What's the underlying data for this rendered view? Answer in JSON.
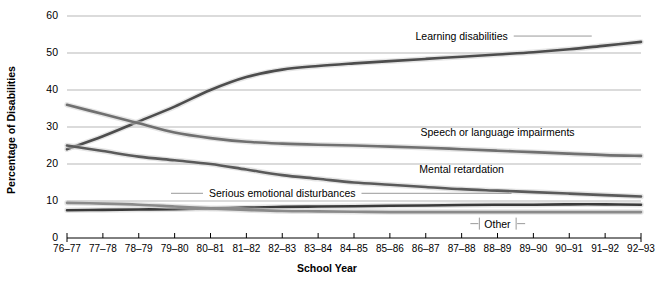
{
  "chart_data": {
    "type": "line",
    "title": "",
    "xlabel": "School Year",
    "ylabel": "Percentage of Disabilities",
    "ylim": [
      0,
      60
    ],
    "yticks": [
      0,
      10,
      20,
      30,
      40,
      50,
      60
    ],
    "grid": true,
    "legend_position": "inline-labels",
    "categories": [
      "76–77",
      "77–78",
      "78–79",
      "79–80",
      "80–81",
      "81–82",
      "82–83",
      "83–84",
      "84–85",
      "85–86",
      "86–87",
      "87–88",
      "88–89",
      "89–90",
      "90–91",
      "91–92",
      "92–93"
    ],
    "series": [
      {
        "name": "Learning disabilities",
        "color": "#4d4d4d",
        "values": [
          24.0,
          27.5,
          31.5,
          35.5,
          40.0,
          43.5,
          45.5,
          46.5,
          47.2,
          47.8,
          48.4,
          49.0,
          49.6,
          50.2,
          51.0,
          52.0,
          53.0
        ]
      },
      {
        "name": "Speech or language impairments",
        "color": "#707070",
        "values": [
          36.0,
          33.5,
          31.0,
          28.5,
          27.0,
          26.0,
          25.5,
          25.2,
          25.0,
          24.7,
          24.4,
          24.0,
          23.6,
          23.2,
          22.8,
          22.4,
          22.2
        ]
      },
      {
        "name": "Mental retardation",
        "color": "#5a5a5a",
        "values": [
          25.0,
          23.5,
          22.0,
          21.0,
          20.0,
          18.5,
          17.0,
          16.0,
          15.0,
          14.4,
          13.8,
          13.2,
          12.8,
          12.4,
          12.0,
          11.6,
          11.2
        ]
      },
      {
        "name": "Serious emotional disturbances",
        "color": "#3a3a3a",
        "values": [
          7.5,
          7.6,
          7.7,
          7.8,
          8.0,
          8.2,
          8.4,
          8.5,
          8.6,
          8.7,
          8.8,
          8.9,
          9.0,
          9.0,
          9.1,
          9.1,
          9.0
        ]
      },
      {
        "name": "Other",
        "color": "#8a8a8a",
        "values": [
          9.5,
          9.3,
          9.0,
          8.5,
          8.0,
          7.6,
          7.3,
          7.2,
          7.1,
          7.0,
          7.0,
          7.0,
          7.0,
          7.0,
          7.0,
          7.0,
          7.0
        ]
      }
    ],
    "annotations": [
      {
        "text": "Learning disabilities",
        "x": "87–88",
        "y": 53.5
      },
      {
        "text": "Speech or language impairments",
        "x": "88–89",
        "y": 27.5
      },
      {
        "text": "Mental retardation",
        "x": "87–88",
        "y": 17.5
      },
      {
        "text": "Serious emotional disturbances",
        "x": "82–83",
        "y": 11.0
      },
      {
        "text": "Other",
        "x": "88–89",
        "y": 2.8
      }
    ]
  }
}
